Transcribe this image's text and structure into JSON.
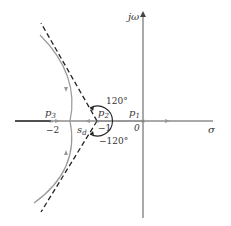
{
  "diagram": {
    "type": "root-locus",
    "axes": {
      "real_label": "σ",
      "imag_label": "jω"
    },
    "poles": [
      {
        "name": "p1",
        "label_main": "p",
        "label_sub": "1",
        "value": "0"
      },
      {
        "name": "p2",
        "label_main": "p",
        "label_sub": "2",
        "value": "−1"
      },
      {
        "name": "p3",
        "label_main": "p",
        "label_sub": "3",
        "value": "−2"
      }
    ],
    "breakaway": {
      "label_main": "s",
      "label_sub": "d"
    },
    "angles": {
      "upper": "120°",
      "lower": "−120°"
    },
    "colors": {
      "axis": "#555555",
      "locus": "#999999",
      "asymptote": "#222222"
    }
  }
}
